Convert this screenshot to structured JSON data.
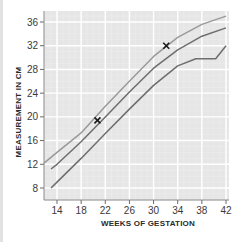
{
  "chart_data": {
    "type": "line",
    "title": "",
    "xlabel": "WEEKS OF GESTATION",
    "ylabel": "MEASUREMENT IN CM",
    "xlim": [
      12,
      42
    ],
    "ylim": [
      6,
      38
    ],
    "x_ticks": [
      14,
      18,
      22,
      26,
      30,
      34,
      38,
      42
    ],
    "y_ticks": [
      8,
      12,
      16,
      20,
      24,
      28,
      32,
      36
    ],
    "grid": true,
    "legend": null,
    "series": [
      {
        "name": "upper-curve",
        "color": "#9a9a9a",
        "points": [
          [
            11.8,
            12.2
          ],
          [
            14,
            14.0
          ],
          [
            18,
            17.3
          ],
          [
            22,
            21.8
          ],
          [
            26,
            26.0
          ],
          [
            30,
            30.2
          ],
          [
            34,
            33.4
          ],
          [
            38,
            35.6
          ],
          [
            42,
            37.0
          ]
        ]
      },
      {
        "name": "middle-curve",
        "color": "#6e6e6e",
        "points": [
          [
            13,
            11.2
          ],
          [
            14,
            12.0
          ],
          [
            18,
            15.8
          ],
          [
            22,
            20.0
          ],
          [
            26,
            24.2
          ],
          [
            30,
            28.2
          ],
          [
            34,
            31.3
          ],
          [
            38,
            33.6
          ],
          [
            42,
            35.0
          ]
        ]
      },
      {
        "name": "lower-curve",
        "color": "#6e6e6e",
        "points": [
          [
            13,
            8.0
          ],
          [
            14,
            9.0
          ],
          [
            18,
            13.0
          ],
          [
            22,
            17.2
          ],
          [
            26,
            21.3
          ],
          [
            30,
            25.3
          ],
          [
            34,
            28.6
          ],
          [
            37,
            29.8
          ],
          [
            40.3,
            29.8
          ],
          [
            42,
            32.0
          ]
        ]
      }
    ],
    "markers": [
      {
        "symbol": "x",
        "x": 20.7,
        "y": 19.4
      },
      {
        "symbol": "x",
        "x": 32.1,
        "y": 32.0
      }
    ]
  },
  "axes": {
    "x_title": "WEEKS OF GESTATION",
    "y_title": "MEASUREMENT IN CM",
    "x_tick_labels": [
      "14",
      "18",
      "22",
      "26",
      "30",
      "34",
      "38",
      "42"
    ],
    "y_tick_labels": [
      "8",
      "12",
      "16",
      "20",
      "24",
      "28",
      "32",
      "36"
    ]
  }
}
